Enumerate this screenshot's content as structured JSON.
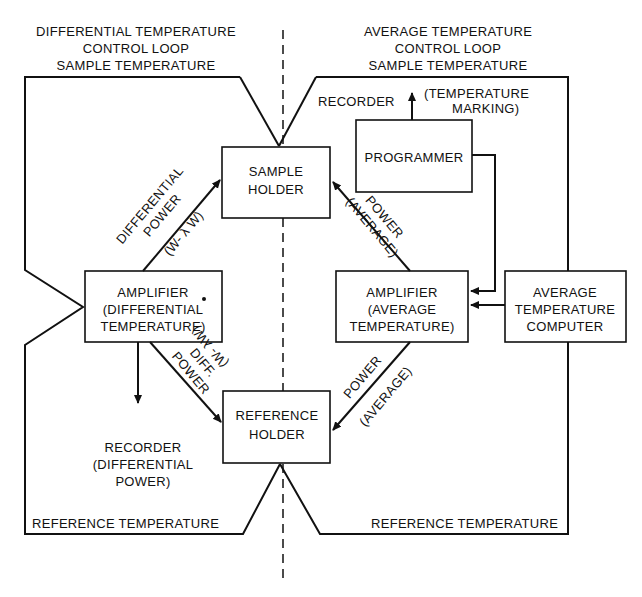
{
  "headings": {
    "left": [
      "DIFFERENTIAL TEMPERATURE",
      "CONTROL LOOP",
      "SAMPLE TEMPERATURE"
    ],
    "right": [
      "AVERAGE TEMPERATURE",
      "CONTROL LOOP",
      "SAMPLE TEMPERATURE"
    ]
  },
  "boxes": {
    "sample_holder": [
      "SAMPLE",
      "HOLDER"
    ],
    "reference_holder": [
      "REFERENCE",
      "HOLDER"
    ],
    "programmer": [
      "PROGRAMMER"
    ],
    "amp_diff": [
      "AMPLIFIER",
      "(DIFFERENTIAL",
      "TEMPERATURE)"
    ],
    "amp_avg": [
      "AMPLIFIER",
      "(AVERAGE",
      "TEMPERATURE)"
    ],
    "avg_computer": [
      "AVERAGE",
      "TEMPERATURE",
      "COMPUTER"
    ]
  },
  "labels": {
    "recorder_top": "RECORDER",
    "temp_marking": [
      "(TEMPERATURE",
      "MARKING)"
    ],
    "recorder_diff": [
      "RECORDER",
      "(DIFFERENTIAL",
      "POWER)"
    ],
    "diff_power_upper": [
      "DIFFERENTIAL",
      "POWER",
      "(W- λ W)"
    ],
    "diff_power_lower": [
      "DIFF.",
      "POWER",
      "(W- λW)"
    ],
    "power_avg_upper": [
      "POWER",
      "(AVERAGE)"
    ],
    "power_avg_lower": [
      "POWER",
      "(AVERAGE)"
    ],
    "ref_temp_left": "REFERENCE TEMPERATURE",
    "ref_temp_right": "REFERENCE TEMPERATURE"
  }
}
